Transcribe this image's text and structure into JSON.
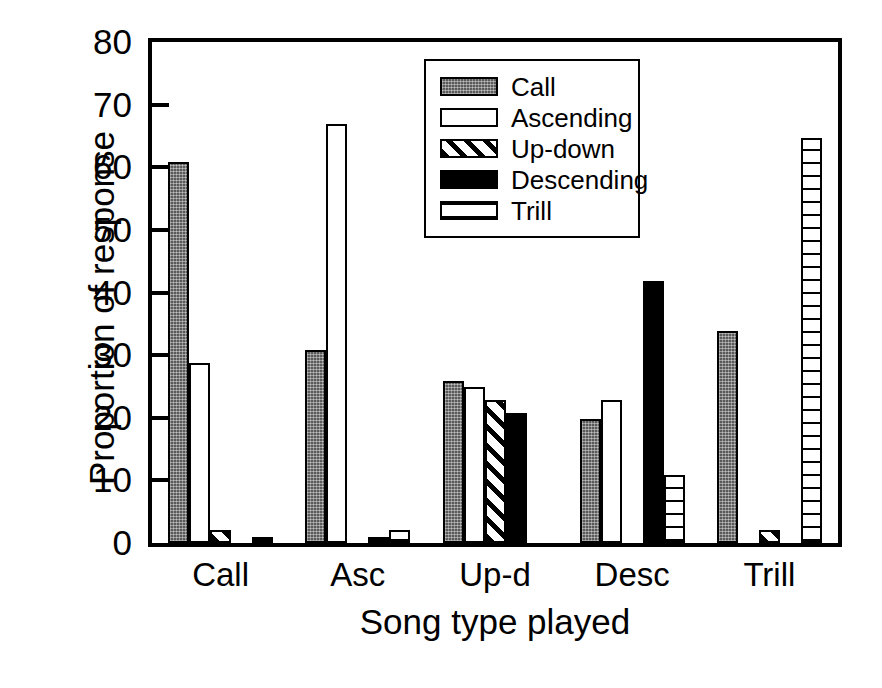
{
  "chart_data": {
    "type": "bar",
    "title": "",
    "xlabel": "Song type played",
    "ylabel": "Proportion of response",
    "categories": [
      "Call",
      "Asc",
      "Up-d",
      "Desc",
      "Trill"
    ],
    "ylim": [
      0,
      80
    ],
    "yticks": [
      0,
      10,
      20,
      30,
      40,
      50,
      60,
      70,
      80
    ],
    "ytick_labels": [
      "0",
      "10",
      "20",
      "30",
      "40",
      "50",
      "60",
      "70",
      "80"
    ],
    "grid": false,
    "legend_position": "upper center",
    "series": [
      {
        "name": "Call",
        "pattern": "solid-gray-speckle",
        "values": [
          60.8,
          30.9,
          25.8,
          19.8,
          33.8
        ]
      },
      {
        "name": "Ascending",
        "pattern": "open-white",
        "values": [
          28.8,
          66.9,
          24.9,
          22.9,
          0.0
        ]
      },
      {
        "name": "Up-down",
        "pattern": "diagonal-hatch",
        "values": [
          2.0,
          0.0,
          22.9,
          0.0,
          2.0
        ]
      },
      {
        "name": "Descending",
        "pattern": "solid-black",
        "values": [
          0.0,
          0.9,
          20.8,
          41.8,
          0.0
        ]
      },
      {
        "name": "Trill",
        "pattern": "horizontal-lines",
        "values": [
          1.0,
          2.0,
          0.0,
          10.9,
          64.7
        ]
      }
    ]
  },
  "legend": {
    "items": [
      {
        "label": "Call",
        "pattern": "solid-gray-speckle"
      },
      {
        "label": "Ascending",
        "pattern": "open-white"
      },
      {
        "label": "Up-down",
        "pattern": "diagonal-hatch"
      },
      {
        "label": "Descending",
        "pattern": "solid-black"
      },
      {
        "label": "Trill",
        "pattern": "horizontal-lines"
      }
    ]
  },
  "colors": {
    "axis": "#000000",
    "background": "#ffffff",
    "call": "#5a5a5a",
    "descending": "#000000"
  }
}
